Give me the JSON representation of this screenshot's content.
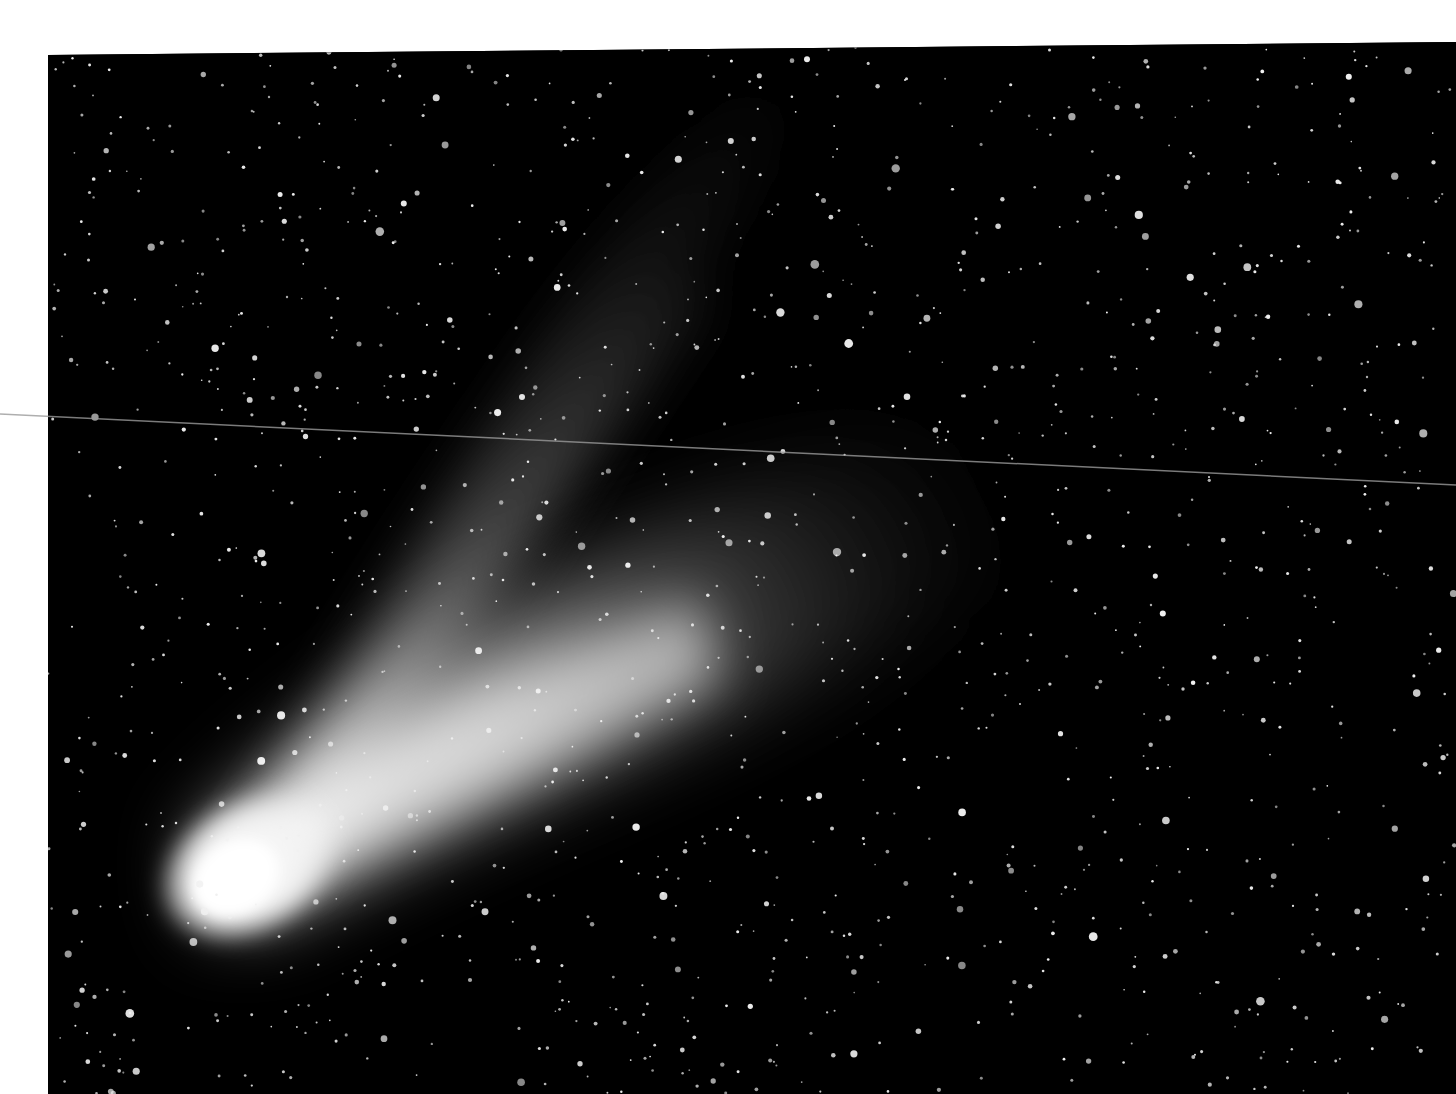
{
  "image": {
    "subject": "comet with ion and dust tails against star field",
    "palette": {
      "background": "#000000",
      "page": "#ffffff",
      "coma": "#ffffff",
      "dust_tail": "#bdbdbd",
      "ion_tail": "#6e6e6e",
      "star": "#f0f0f0",
      "scan_line": "#9a9a9a"
    },
    "frame": {
      "left": 48,
      "top_left": 55,
      "top_right": 42
    },
    "coma_center": [
      240,
      870
    ],
    "star_count": 1400
  }
}
